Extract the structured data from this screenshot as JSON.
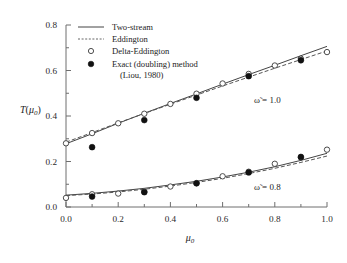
{
  "chart_data": {
    "type": "scatter",
    "title": "",
    "xlabel": "μ₀",
    "ylabel": "T(μ₀)",
    "xlim": [
      0.0,
      1.0
    ],
    "ylim": [
      0.0,
      0.8
    ],
    "xticks": [
      "0.0",
      "0.2",
      "0.4",
      "0.6",
      "0.8",
      "1.0"
    ],
    "xtick_values": [
      0.0,
      0.2,
      0.4,
      0.6,
      0.8,
      1.0
    ],
    "yticks": [
      "0.0",
      "0.2",
      "0.4",
      "0.6",
      "0.8"
    ],
    "ytick_values": [
      0.0,
      0.2,
      0.4,
      0.6,
      0.8
    ],
    "xminor_values": [
      0.1,
      0.3,
      0.5,
      0.7,
      0.9
    ],
    "yminor_values": [
      0.1,
      0.3,
      0.5,
      0.7
    ],
    "grid": false,
    "legend_position": "top-left",
    "legend": [
      {
        "label": "Two-stream",
        "marker": "line-solid"
      },
      {
        "label": "Eddington",
        "marker": "line-dashed"
      },
      {
        "label": "Delta-Eddington",
        "marker": "circle-open"
      },
      {
        "label": "Exact (doubling) method",
        "marker": "circle-filled"
      },
      {
        "label": "(Liou, 1980)",
        "marker": "none"
      }
    ],
    "annotations": [
      {
        "text": "ω̃ = 1.0",
        "x": 0.72,
        "y": 0.455
      },
      {
        "text": "ω̃ = 0.8",
        "x": 0.72,
        "y": 0.075
      }
    ],
    "series": [
      {
        "name": "Two-stream",
        "group": "ω̃ = 1.0",
        "style": "line-solid",
        "x": [
          0.0,
          0.1,
          0.2,
          0.3,
          0.4,
          0.5,
          0.6,
          0.7,
          0.8,
          0.9,
          1.0
        ],
        "values": [
          0.278,
          0.322,
          0.368,
          0.412,
          0.455,
          0.497,
          0.54,
          0.582,
          0.623,
          0.665,
          0.706
        ]
      },
      {
        "name": "Eddington",
        "group": "ω̃ = 1.0",
        "style": "line-dashed",
        "x": [
          0.0,
          0.1,
          0.2,
          0.3,
          0.4,
          0.5,
          0.6,
          0.7,
          0.8,
          0.9,
          1.0
        ],
        "values": [
          0.285,
          0.327,
          0.37,
          0.411,
          0.452,
          0.492,
          0.532,
          0.571,
          0.61,
          0.648,
          0.686
        ]
      },
      {
        "name": "Delta-Eddington",
        "group": "ω̃ = 1.0",
        "style": "circle-open",
        "x": [
          0.0,
          0.1,
          0.2,
          0.3,
          0.4,
          0.5,
          0.6,
          0.7,
          0.8,
          0.9,
          1.0
        ],
        "values": [
          0.28,
          0.325,
          0.368,
          0.41,
          0.453,
          0.498,
          0.543,
          0.585,
          0.622,
          0.652,
          0.681
        ]
      },
      {
        "name": "Exact (doubling) method",
        "group": "ω̃ = 1.0",
        "style": "circle-filled",
        "x": [
          0.1,
          0.3,
          0.5,
          0.7,
          0.9
        ],
        "values": [
          0.263,
          0.382,
          0.48,
          0.575,
          0.645
        ]
      },
      {
        "name": "Two-stream",
        "group": "ω̃ = 0.8",
        "style": "line-solid",
        "x": [
          0.0,
          0.1,
          0.2,
          0.3,
          0.4,
          0.5,
          0.6,
          0.7,
          0.8,
          0.9,
          1.0
        ],
        "values": [
          0.052,
          0.06,
          0.07,
          0.082,
          0.097,
          0.113,
          0.132,
          0.153,
          0.177,
          0.205,
          0.236
        ]
      },
      {
        "name": "Eddington",
        "group": "ω̃ = 0.8",
        "style": "line-dashed",
        "x": [
          0.0,
          0.1,
          0.2,
          0.3,
          0.4,
          0.5,
          0.6,
          0.7,
          0.8,
          0.9,
          1.0
        ],
        "values": [
          0.05,
          0.057,
          0.066,
          0.078,
          0.092,
          0.108,
          0.126,
          0.147,
          0.17,
          0.196,
          0.224
        ]
      },
      {
        "name": "Delta-Eddington",
        "group": "ω̃ = 0.8",
        "style": "circle-open",
        "x": [
          0.0,
          0.1,
          0.2,
          0.3,
          0.4,
          0.5,
          0.6,
          0.7,
          0.8,
          0.9,
          1.0
        ],
        "values": [
          0.04,
          0.056,
          0.059,
          0.068,
          0.09,
          0.105,
          0.135,
          0.155,
          0.19,
          0.218,
          0.252
        ]
      },
      {
        "name": "Exact (doubling) method",
        "group": "ω̃ = 0.8",
        "style": "circle-filled",
        "x": [
          0.1,
          0.3,
          0.5,
          0.7,
          0.9
        ],
        "values": [
          0.046,
          0.065,
          0.104,
          0.152,
          0.22
        ]
      }
    ],
    "colors": {
      "axis": "#6e6e6e",
      "solid_line": "#444444",
      "dashed_line": "#555555",
      "marker_open": "#ffffff",
      "marker_open_stroke": "#3a3a3a",
      "marker_filled": "#111111",
      "text": "#1a1a1a",
      "background": "#ffffff"
    }
  }
}
